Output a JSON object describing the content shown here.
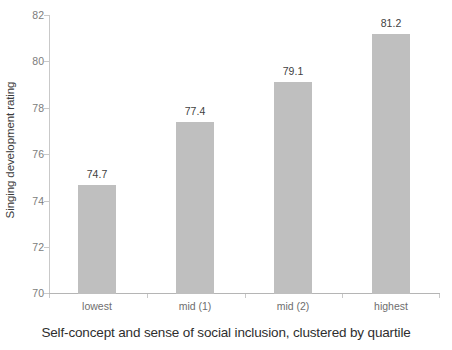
{
  "chart_data": {
    "type": "bar",
    "title": "",
    "categories": [
      "lowest",
      "mid (1)",
      "mid (2)",
      "highest"
    ],
    "values": [
      74.7,
      77.4,
      79.1,
      81.2
    ],
    "value_labels": [
      "74.7",
      "77.4",
      "79.1",
      "81.2"
    ],
    "xlabel": "Self-concept and sense of social inclusion, clustered by quartile",
    "ylabel": "Singing development rating",
    "ylim": [
      70,
      82
    ],
    "ytick_labels": [
      "82",
      "80",
      "78",
      "76",
      "74",
      "72",
      "70"
    ],
    "ytick_values": [
      82,
      80,
      78,
      76,
      74,
      72,
      70
    ],
    "grid": false,
    "legend": null,
    "bar_color": "#bfbfbf",
    "axis_color": "#c9c9c9",
    "value_label_color": "#414141",
    "tick_label_color": "#7c7c7c"
  }
}
